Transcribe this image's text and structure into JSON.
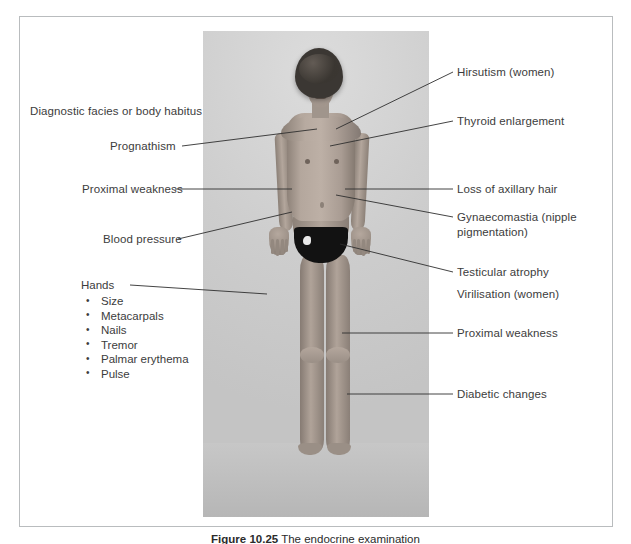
{
  "figure": {
    "caption_bold": "Figure 10.25",
    "caption_rest": "The endocrine examination",
    "frame_color": "#b9bcbe",
    "text_color": "#3c3c3c",
    "photo_background": "#cfcfcf"
  },
  "labels_left": [
    {
      "id": "diagnostic-facies",
      "text": "Diagnostic facies or body habitus"
    },
    {
      "id": "prognathism",
      "text": "Prognathism"
    },
    {
      "id": "proximal-weakness-upper",
      "text": "Proximal weakness"
    },
    {
      "id": "blood-pressure",
      "text": "Blood pressure"
    }
  ],
  "hands": {
    "title": "Hands",
    "items": [
      "Size",
      "Metacarpals",
      "Nails",
      "Tremor",
      "Palmar erythema",
      "Pulse"
    ]
  },
  "labels_right": [
    {
      "id": "hirsutism",
      "text": "Hirsutism (women)"
    },
    {
      "id": "thyroid-enlargement",
      "text": "Thyroid enlargement"
    },
    {
      "id": "loss-axillary-hair",
      "text": "Loss of axillary hair"
    },
    {
      "id": "gynaecomastia",
      "text": "Gynaecomastia (nipple pigmentation)"
    },
    {
      "id": "testicular-atrophy",
      "text": "Testicular atrophy"
    },
    {
      "id": "virilisation",
      "text": "Virilisation (women)"
    },
    {
      "id": "proximal-weakness-lower",
      "text": "Proximal weakness"
    },
    {
      "id": "diabetic-changes",
      "text": "Diabetic changes"
    }
  ]
}
